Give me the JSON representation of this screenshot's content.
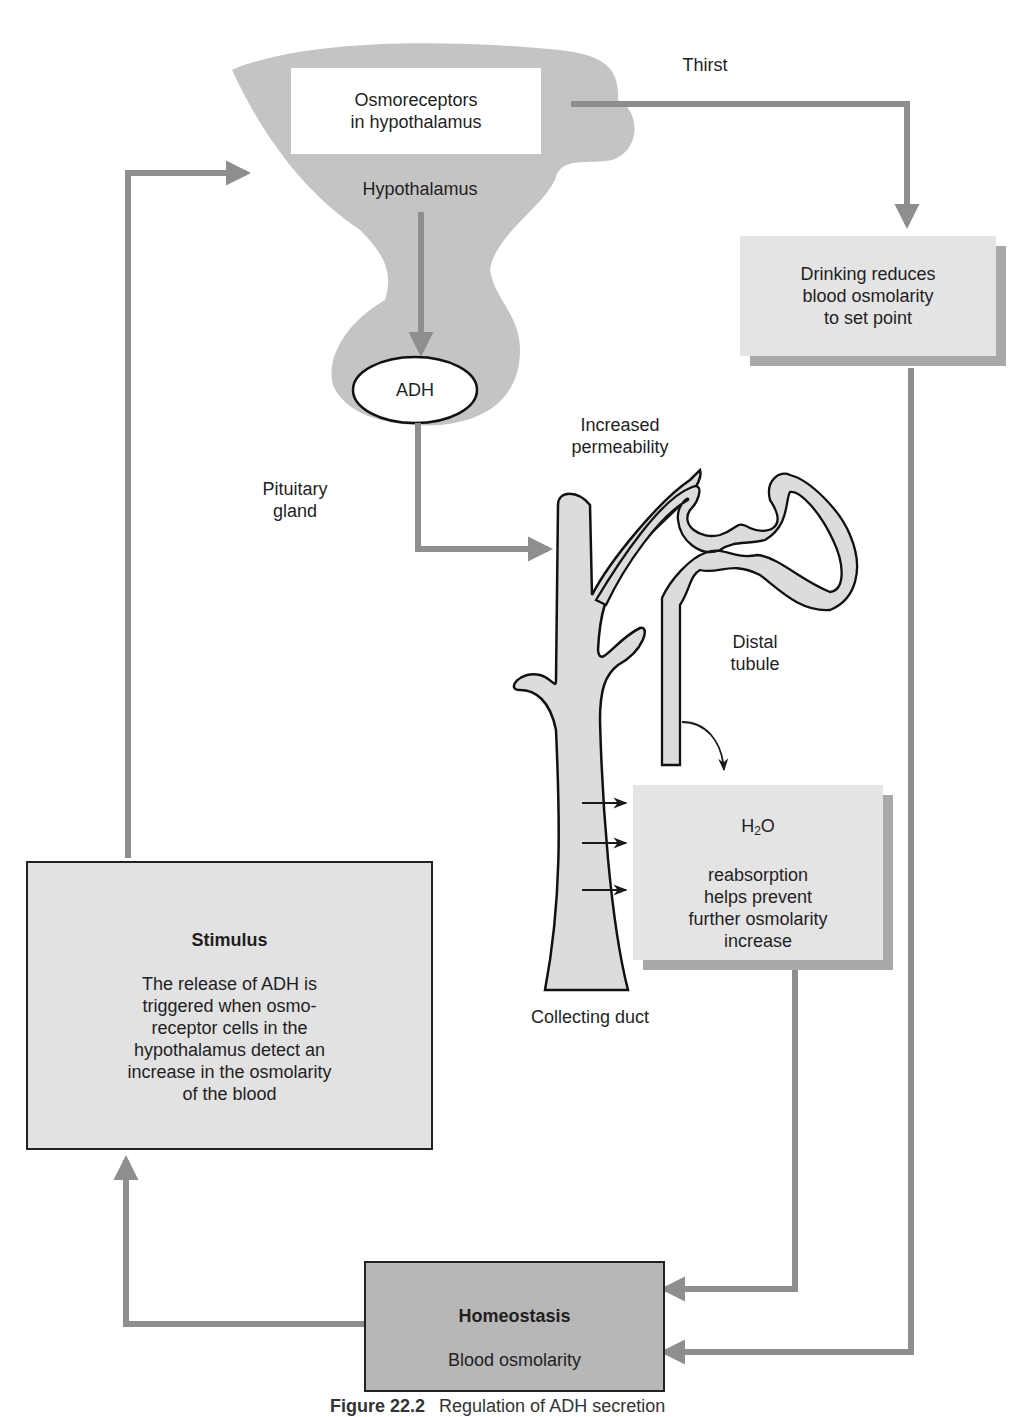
{
  "diagram": {
    "title": "Regulation of ADH secretion",
    "nodes": {
      "osmoreceptors": {
        "text": "Osmoreceptors\nin hypothalamus"
      },
      "hypothalamus": {
        "text": "Hypothalamus"
      },
      "adh": {
        "text": "ADH"
      },
      "pituitary": {
        "text": "Pituitary\ngland"
      },
      "thirst": {
        "text": "Thirst"
      },
      "drinking": {
        "text": "Drinking reduces\nblood osmolarity\nto set point"
      },
      "increased_permeability": {
        "text": "Increased\npermeability"
      },
      "distal_tubule": {
        "text": "Distal\ntubule"
      },
      "collecting_duct": {
        "text": "Collecting duct"
      },
      "h2o": {
        "formula_main": "H",
        "formula_sub": "2",
        "formula_end": "O",
        "text": "reabsorption\nhelps prevent\nfurther osmolarity\nincrease"
      },
      "stimulus": {
        "title": "Stimulus",
        "text": "The release of ADH is\ntriggered when osmo-\nreceptor cells in the\nhypothalamus detect an\nincrease in the osmolarity\nof the blood"
      },
      "homeostasis": {
        "title": "Homeostasis",
        "text": "Blood osmolarity"
      }
    },
    "edges": [
      {
        "from": "stimulus",
        "to": "hypothalamus"
      },
      {
        "from": "osmoreceptors",
        "to": "drinking",
        "label": "Thirst"
      },
      {
        "from": "hypothalamus",
        "to": "adh"
      },
      {
        "from": "adh",
        "to": "collecting_duct",
        "label": "Increased permeability"
      },
      {
        "from": "distal_tubule",
        "to": "h2o"
      },
      {
        "from": "collecting_duct",
        "to": "h2o"
      },
      {
        "from": "h2o",
        "to": "homeostasis"
      },
      {
        "from": "drinking",
        "to": "homeostasis"
      },
      {
        "from": "homeostasis",
        "to": "stimulus"
      }
    ],
    "colors": {
      "arrow": "#8e8e8e",
      "brain_fill": "#c4c4c4",
      "tubule_fill": "#dcdcdc",
      "box_light": "#e4e4e4",
      "box_dark": "#b7b7b7",
      "shadow": "#a9a9a9",
      "outline": "#1a1a1a"
    }
  },
  "caption": {
    "figure_number": "Figure 22.2",
    "text": "Regulation of ADH secretion"
  }
}
